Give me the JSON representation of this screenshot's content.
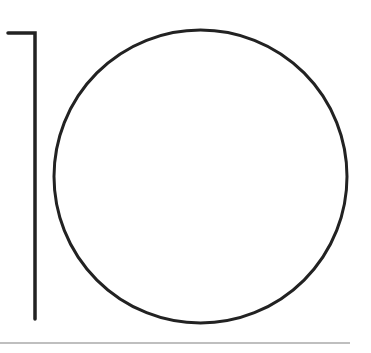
{
  "figure": {
    "stroke_color": "#222222",
    "baseline_color": "#aaaaaa",
    "background_color": "#ffffff",
    "glyphs": [
      "1",
      "0"
    ]
  }
}
